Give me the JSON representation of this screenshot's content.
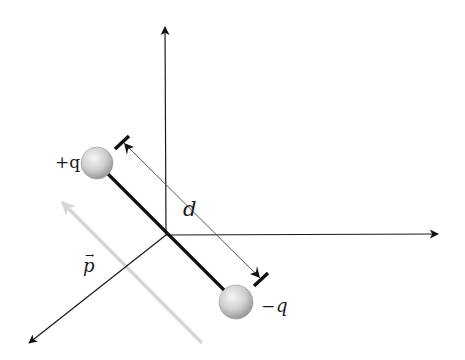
{
  "diagram": {
    "labels": {
      "positive_charge": "+q",
      "negative_charge_sign": "−",
      "negative_charge_symbol": "q",
      "separation": "d",
      "dipole_moment": "p",
      "dipole_moment_arrow": "→"
    },
    "colors": {
      "axis": "#1a1a1a",
      "rod": "#111111",
      "dimension_line": "#555555",
      "dipole_arrow": "#d6d6d6",
      "sphere_light": "#f4f4f4",
      "sphere_dark": "#9a9a9a",
      "background": "#ffffff"
    },
    "geometry": {
      "origin": [
        166,
        235
      ],
      "z_axis_tip": [
        165,
        25
      ],
      "x_axis_tip": [
        440,
        234
      ],
      "y_axis_tip": [
        27,
        345
      ],
      "positive_charge_center": [
        97,
        163
      ],
      "negative_charge_center": [
        236,
        302
      ],
      "sphere_radius": 16
    }
  }
}
